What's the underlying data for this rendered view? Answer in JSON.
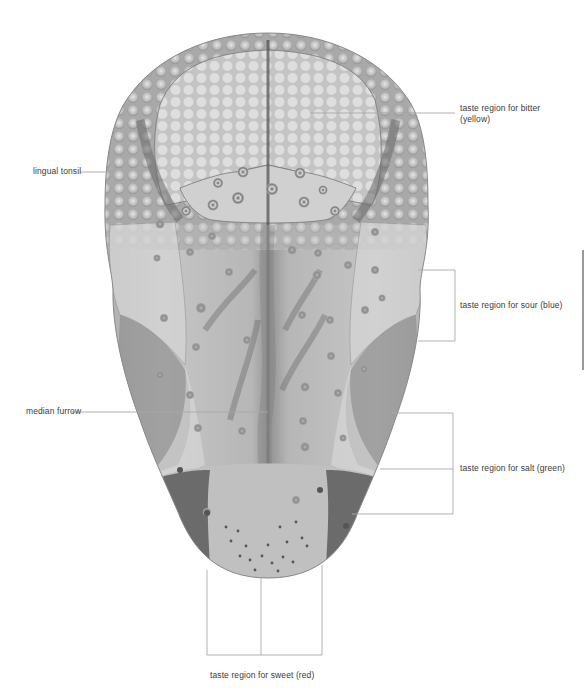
{
  "diagram": {
    "labels": {
      "bitter": "taste region for bitter (yellow)",
      "bitter_line1": "taste region for bitter",
      "bitter_line2": "(yellow)",
      "lingual_tonsil": "lingual tonsil",
      "sour": "taste region for sour (blue)",
      "median_furrow": "median furrow",
      "salt": "taste region for salt (green)",
      "sweet": "taste region for sweet (red)"
    },
    "colors": {
      "background": "#ffffff",
      "label_text": "#3a3a3a",
      "leader_line": "#a8a8a8",
      "tongue_base": "#b9b9b9",
      "tongue_light": "#d6d6d6",
      "tongue_dark": "#6e6e6e",
      "tip_dark": "#5a5a5a"
    }
  }
}
